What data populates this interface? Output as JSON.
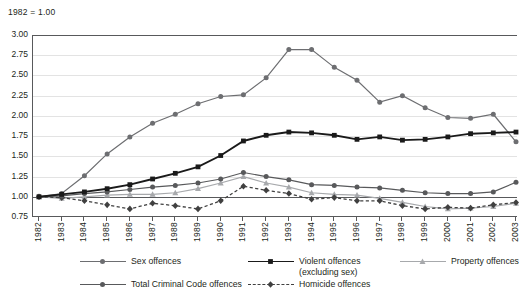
{
  "note": "1982 = 1.00",
  "axes": {
    "y_ticks": [
      "3.00",
      "2.75",
      "2.50",
      "2.25",
      "2.00",
      "1.75",
      "1.50",
      "1.25",
      "1.00",
      "0.75"
    ],
    "x_ticks": [
      "1982",
      "1983",
      "1984",
      "1985",
      "1986",
      "1987",
      "1988",
      "1989",
      "1990",
      "1991",
      "1992",
      "1993",
      "1994",
      "1995",
      "1996",
      "1997",
      "1998",
      "1999",
      "2000",
      "2001",
      "2002",
      "2003"
    ]
  },
  "legend": {
    "items": [
      {
        "label": "Sex offences",
        "color": "#6d6e71",
        "marker": "circle",
        "dash": false
      },
      {
        "label": "Violent offences",
        "sub": "(excluding sex)",
        "color": "#1a1a1a",
        "marker": "square",
        "dash": false
      },
      {
        "label": "Property offences",
        "color": "#a7a9ac",
        "marker": "triangle",
        "dash": false
      },
      {
        "label": "Total Criminal Code offences",
        "color": "#58595b",
        "marker": "circle",
        "dash": false
      },
      {
        "label": "Homicide offences",
        "color": "#404040",
        "marker": "diamond",
        "dash": true
      }
    ]
  },
  "chart_data": {
    "type": "line",
    "title": "",
    "subtitle": "",
    "xlabel": "",
    "ylabel": "",
    "annotation": "1982 = 1.00",
    "grid": true,
    "legend_position": "bottom",
    "ylim": [
      0.75,
      3.0
    ],
    "ytick_step": 0.25,
    "x": [
      1982,
      1983,
      1984,
      1985,
      1986,
      1987,
      1988,
      1989,
      1990,
      1991,
      1992,
      1993,
      1994,
      1995,
      1996,
      1997,
      1998,
      1999,
      2000,
      2001,
      2002,
      2003
    ],
    "series": [
      {
        "name": "Sex offences",
        "color": "#6d6e71",
        "marker": "circle",
        "values": [
          1.0,
          1.04,
          1.26,
          1.53,
          1.74,
          1.91,
          2.02,
          2.15,
          2.24,
          2.26,
          2.47,
          2.82,
          2.82,
          2.6,
          2.44,
          2.17,
          2.25,
          2.1,
          1.98,
          1.97,
          2.02,
          1.68
        ]
      },
      {
        "name": "Violent offences (excluding sex)",
        "color": "#1a1a1a",
        "marker": "square",
        "values": [
          1.0,
          1.03,
          1.06,
          1.1,
          1.15,
          1.22,
          1.29,
          1.37,
          1.51,
          1.69,
          1.76,
          1.8,
          1.79,
          1.76,
          1.71,
          1.74,
          1.7,
          1.71,
          1.74,
          1.78,
          1.79,
          1.8
        ]
      },
      {
        "name": "Property offences",
        "color": "#a7a9ac",
        "marker": "triangle",
        "values": [
          1.0,
          0.98,
          1.0,
          1.02,
          1.03,
          1.03,
          1.05,
          1.1,
          1.17,
          1.25,
          1.17,
          1.12,
          1.05,
          1.03,
          1.02,
          0.98,
          0.93,
          0.88,
          0.85,
          0.86,
          0.88,
          0.92
        ]
      },
      {
        "name": "Total Criminal Code offences",
        "color": "#58595b",
        "marker": "circle",
        "values": [
          1.0,
          1.01,
          1.04,
          1.06,
          1.09,
          1.12,
          1.14,
          1.17,
          1.22,
          1.3,
          1.25,
          1.21,
          1.15,
          1.14,
          1.12,
          1.11,
          1.08,
          1.05,
          1.04,
          1.04,
          1.06,
          1.18
        ]
      },
      {
        "name": "Homicide offences",
        "color": "#404040",
        "marker": "diamond",
        "dash": true,
        "values": [
          1.0,
          0.99,
          0.95,
          0.9,
          0.85,
          0.92,
          0.89,
          0.85,
          0.95,
          1.13,
          1.08,
          1.04,
          0.97,
          0.99,
          0.95,
          0.95,
          0.89,
          0.85,
          0.87,
          0.86,
          0.9,
          0.93
        ]
      }
    ]
  }
}
